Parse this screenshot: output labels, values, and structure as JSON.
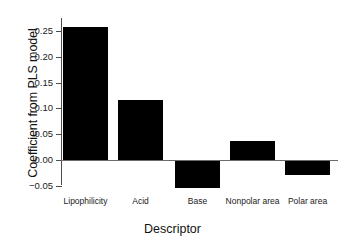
{
  "chart_data": {
    "type": "bar",
    "title": "",
    "xlabel": "Descriptor",
    "ylabel": "Coefficient from PLS model",
    "categories": [
      "Lipophilicity",
      "Acid",
      "Base",
      "Nonpolar area",
      "Polar area"
    ],
    "values": [
      0.258,
      0.116,
      -0.054,
      0.036,
      -0.029
    ],
    "ylim": [
      -0.07,
      0.275
    ],
    "yticks": [
      0.25,
      0.2,
      0.15,
      0.1,
      0.05,
      0.0,
      -0.05
    ],
    "ytick_labels": [
      "0.25",
      "0.20",
      "0.15",
      "0.10",
      "0.05",
      "0.00",
      "-0.05"
    ],
    "grid": false,
    "legend": null,
    "bar_color": "#000000",
    "zero_line": 0.0
  }
}
